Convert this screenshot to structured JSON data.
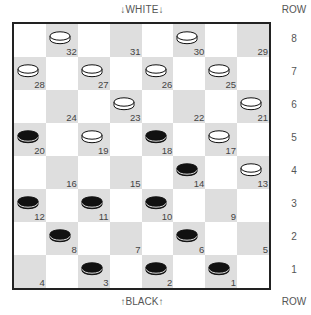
{
  "labels": {
    "top": "↓WHITE↓",
    "bottom": "↑BLACK↑",
    "row_header_top": "ROW",
    "row_header_bottom": "ROW"
  },
  "rows": [
    "8",
    "7",
    "6",
    "5",
    "4",
    "3",
    "2",
    "1"
  ],
  "colors": {
    "dark_square": "#dedede",
    "light_square": "#ffffff",
    "border": "#222222",
    "white_piece": "#ffffff",
    "black_piece": "#111111"
  },
  "squares": [
    {
      "n": "32",
      "row": 0,
      "col": 1,
      "piece": "white"
    },
    {
      "n": "31",
      "row": 0,
      "col": 3,
      "piece": ""
    },
    {
      "n": "30",
      "row": 0,
      "col": 5,
      "piece": "white"
    },
    {
      "n": "29",
      "row": 0,
      "col": 7,
      "piece": ""
    },
    {
      "n": "28",
      "row": 1,
      "col": 0,
      "piece": "white"
    },
    {
      "n": "27",
      "row": 1,
      "col": 2,
      "piece": "white"
    },
    {
      "n": "26",
      "row": 1,
      "col": 4,
      "piece": "white"
    },
    {
      "n": "25",
      "row": 1,
      "col": 6,
      "piece": "white"
    },
    {
      "n": "24",
      "row": 2,
      "col": 1,
      "piece": ""
    },
    {
      "n": "23",
      "row": 2,
      "col": 3,
      "piece": "white"
    },
    {
      "n": "22",
      "row": 2,
      "col": 5,
      "piece": ""
    },
    {
      "n": "21",
      "row": 2,
      "col": 7,
      "piece": "white"
    },
    {
      "n": "20",
      "row": 3,
      "col": 0,
      "piece": "black"
    },
    {
      "n": "19",
      "row": 3,
      "col": 2,
      "piece": "white"
    },
    {
      "n": "18",
      "row": 3,
      "col": 4,
      "piece": "black"
    },
    {
      "n": "17",
      "row": 3,
      "col": 6,
      "piece": "white"
    },
    {
      "n": "16",
      "row": 4,
      "col": 1,
      "piece": ""
    },
    {
      "n": "15",
      "row": 4,
      "col": 3,
      "piece": ""
    },
    {
      "n": "14",
      "row": 4,
      "col": 5,
      "piece": "black"
    },
    {
      "n": "13",
      "row": 4,
      "col": 7,
      "piece": "white"
    },
    {
      "n": "12",
      "row": 5,
      "col": 0,
      "piece": "black"
    },
    {
      "n": "11",
      "row": 5,
      "col": 2,
      "piece": "black"
    },
    {
      "n": "10",
      "row": 5,
      "col": 4,
      "piece": "black"
    },
    {
      "n": "9",
      "row": 5,
      "col": 6,
      "piece": ""
    },
    {
      "n": "8",
      "row": 6,
      "col": 1,
      "piece": "black"
    },
    {
      "n": "7",
      "row": 6,
      "col": 3,
      "piece": ""
    },
    {
      "n": "6",
      "row": 6,
      "col": 5,
      "piece": "black"
    },
    {
      "n": "5",
      "row": 6,
      "col": 7,
      "piece": ""
    },
    {
      "n": "4",
      "row": 7,
      "col": 0,
      "piece": ""
    },
    {
      "n": "3",
      "row": 7,
      "col": 2,
      "piece": "black"
    },
    {
      "n": "2",
      "row": 7,
      "col": 4,
      "piece": "black"
    },
    {
      "n": "1",
      "row": 7,
      "col": 6,
      "piece": "black"
    }
  ]
}
